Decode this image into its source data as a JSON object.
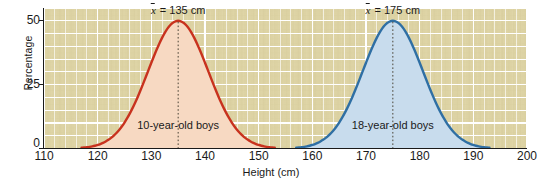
{
  "chart_data": {
    "type": "area",
    "title": "",
    "xlabel": "Height (cm)",
    "ylabel": "Percentage",
    "xlim": [
      110,
      200
    ],
    "ylim": [
      0,
      55
    ],
    "grid": true,
    "legend_position": "inline-annotation",
    "xticks": [
      "110",
      "120",
      "130",
      "140",
      "150",
      "160",
      "170",
      "180",
      "190",
      "200"
    ],
    "xtick_values": [
      110,
      120,
      130,
      140,
      150,
      160,
      170,
      180,
      190,
      200
    ],
    "yticks": [
      "0",
      "25",
      "50"
    ],
    "ytick_values": [
      0,
      25,
      50
    ],
    "series": [
      {
        "name": "10-year-old boys",
        "color": "#c8321e",
        "fill": "#f7d9c2",
        "mean": 135,
        "mean_label": "= 135 cm",
        "peak_percentage": 50,
        "std_dev": 5.6,
        "x_range": [
          117,
          153
        ],
        "x": [
          117,
          119,
          121,
          123,
          125,
          127,
          129,
          131,
          133,
          135,
          137,
          139,
          141,
          143,
          145,
          147,
          149,
          151,
          153
        ],
        "values": [
          0.5,
          1.2,
          2.6,
          5.0,
          8.8,
          14.3,
          21.3,
          29.6,
          38.3,
          46.0,
          50.0,
          46.0,
          38.3,
          29.6,
          21.3,
          14.3,
          8.8,
          5.0,
          2.6
        ]
      },
      {
        "name": "18-year-old boys",
        "color": "#2f6fa4",
        "fill": "#c8dced",
        "mean": 175,
        "mean_label": "= 175 cm",
        "peak_percentage": 50,
        "std_dev": 5.6,
        "x_range": [
          157,
          193
        ],
        "x": [
          157,
          159,
          161,
          163,
          165,
          167,
          169,
          171,
          173,
          175,
          177,
          179,
          181,
          183,
          185,
          187,
          189,
          191,
          193
        ],
        "values": [
          0.5,
          1.2,
          2.6,
          5.0,
          8.8,
          14.3,
          21.3,
          29.6,
          38.3,
          46.0,
          50.0,
          46.0,
          38.3,
          29.6,
          21.3,
          14.3,
          8.8,
          5.0,
          2.6
        ]
      }
    ],
    "annotations": [
      {
        "text": "= 135 cm",
        "symbol": "x",
        "at_x": 135,
        "at_y": 54
      },
      {
        "text": "= 175 cm",
        "symbol": "x",
        "at_x": 175,
        "at_y": 54
      },
      {
        "text": "10-year-old boys",
        "at_x": 135,
        "at_y": 9
      },
      {
        "text": "18-year-old boys",
        "at_x": 175,
        "at_y": 9
      }
    ],
    "colors": {
      "plot_background": "#ddd3a4",
      "gridline": "#ffffff",
      "axis": "#1a1a1a",
      "red_curve": "#c8321e",
      "red_fill": "#f7d9c2",
      "blue_curve": "#2f6fa4",
      "blue_fill": "#c8dced"
    }
  }
}
